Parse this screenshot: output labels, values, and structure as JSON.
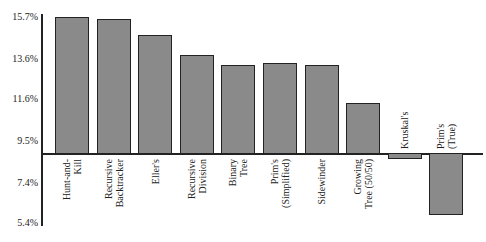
{
  "chart_data": {
    "type": "bar",
    "title": "",
    "xlabel": "",
    "ylabel": "",
    "categories": [
      "Hunt-and-Kill",
      "Recursive Backtracker",
      "Eller's",
      "Recursive Division",
      "Binary Tree",
      "Prim's (Simplified)",
      "Sidewinder",
      "Growing Tree (50/50)",
      "Kruskal's",
      "Prim's (True)"
    ],
    "category_labels": [
      "Hunt-and-\nKill",
      "Recursive\nBacktracker",
      "Eller's",
      "Recursive\nDivision",
      "Binary\nTree",
      "Prim's\n(Simplified)",
      "Sidewinder",
      "Growing\nTree (50/50)",
      "Kruskal's",
      "Prim's\n(True)"
    ],
    "values": [
      15.7,
      15.6,
      14.8,
      13.8,
      13.3,
      13.4,
      13.3,
      11.4,
      8.6,
      5.8
    ],
    "baseline": 8.9,
    "ylim": [
      5.4,
      15.7
    ],
    "yticks": [
      "15.7%",
      "13.6%",
      "11.6%",
      "9.5%",
      "7.4%",
      "5.4%"
    ],
    "ytick_values": [
      15.7,
      13.6,
      11.6,
      9.5,
      7.4,
      5.4
    ],
    "grid": false,
    "legend": null,
    "bar_color": "#8a8a8a",
    "edge_color": "#222222"
  }
}
